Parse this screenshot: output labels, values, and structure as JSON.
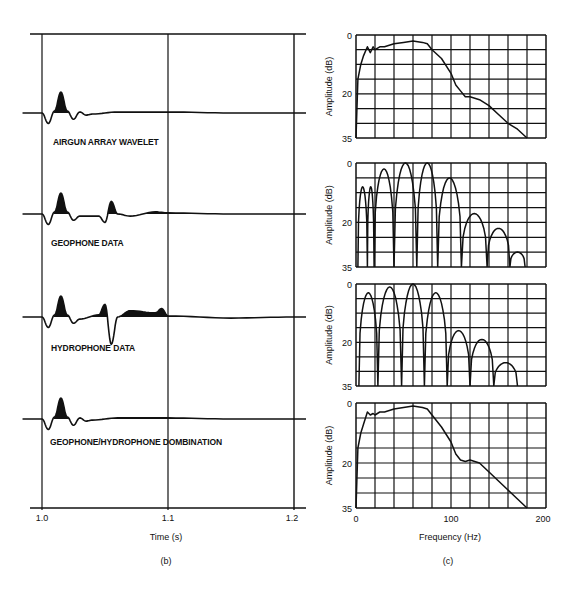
{
  "figure": {
    "panel_b": {
      "caption": "(b)",
      "xlabel": "Time (s)",
      "xticks": [
        "1.0",
        "1.1",
        "1.2"
      ],
      "traces": [
        {
          "label": "AIRGUN ARRAY WAVELET"
        },
        {
          "label": "GEOPHONE DATA"
        },
        {
          "label": "HYDROPHONE DATA"
        },
        {
          "label": "GEOPHONE/HYDROPHONE DOMBINATION"
        }
      ]
    },
    "panel_c": {
      "caption": "(c)",
      "xlabel": "Frequency (Hz)",
      "ylabel": "Amplitude (dB)",
      "xticks": [
        "0",
        "100",
        "200"
      ],
      "yticks": [
        "0",
        "20",
        "35"
      ]
    }
  },
  "chart_data": [
    {
      "type": "line",
      "title": "Panel (b): time-domain traces",
      "xlabel": "Time (s)",
      "ylabel": "",
      "xlim": [
        1.0,
        1.2
      ],
      "xticks": [
        1.0,
        1.1,
        1.2
      ],
      "grid": true,
      "series": [
        {
          "name": "AIRGUN ARRAY WAVELET",
          "x": [
            0.985,
            1.0,
            1.005,
            1.01,
            1.015,
            1.02,
            1.025,
            1.03,
            1.035,
            1.04,
            1.06,
            1.1,
            1.15,
            1.2
          ],
          "values": [
            0,
            0,
            -0.5,
            0.1,
            1.0,
            0.1,
            -0.3,
            0.05,
            -0.1,
            -0.05,
            0.05,
            0.05,
            0,
            0
          ]
        },
        {
          "name": "GEOPHONE DATA",
          "x": [
            0.985,
            1.0,
            1.005,
            1.01,
            1.015,
            1.02,
            1.025,
            1.03,
            1.045,
            1.05,
            1.055,
            1.06,
            1.07,
            1.09,
            1.1,
            1.15,
            1.2
          ],
          "values": [
            0,
            0,
            -0.5,
            0.1,
            1.0,
            0.1,
            -0.3,
            -0.1,
            -0.1,
            -0.4,
            0.6,
            0.0,
            -0.1,
            0.1,
            0.05,
            0,
            0
          ]
        },
        {
          "name": "HYDROPHONE DATA",
          "x": [
            0.985,
            1.0,
            1.005,
            1.01,
            1.015,
            1.02,
            1.025,
            1.03,
            1.045,
            1.05,
            1.055,
            1.06,
            1.07,
            1.09,
            1.095,
            1.1,
            1.15,
            1.2
          ],
          "values": [
            0,
            0,
            -0.5,
            0.1,
            1.0,
            0.1,
            -0.3,
            -0.1,
            0.1,
            0.6,
            -1.3,
            0.0,
            0.3,
            0.2,
            0.4,
            0.05,
            -0.05,
            0
          ]
        },
        {
          "name": "GEOPHONE/HYDROPHONE DOMBINATION",
          "x": [
            0.985,
            1.0,
            1.005,
            1.01,
            1.015,
            1.02,
            1.025,
            1.03,
            1.035,
            1.04,
            1.06,
            1.1,
            1.15,
            1.2
          ],
          "values": [
            0,
            0,
            -0.5,
            0.1,
            1.0,
            0.1,
            -0.3,
            0.05,
            -0.1,
            -0.05,
            0.05,
            0.05,
            0,
            0
          ]
        }
      ]
    },
    {
      "type": "line",
      "title": "Panel (c) #1: Airgun array wavelet spectrum",
      "xlabel": "Frequency (Hz)",
      "ylabel": "Amplitude (dB)",
      "xlim": [
        0,
        200
      ],
      "ylim": [
        35,
        0
      ],
      "grid": true,
      "x": [
        0,
        2,
        5,
        8,
        12,
        15,
        18,
        20,
        25,
        30,
        40,
        50,
        60,
        70,
        75,
        80,
        90,
        100,
        105,
        110,
        115,
        120,
        130,
        140,
        150,
        160,
        170,
        180
      ],
      "values": [
        35,
        15,
        10,
        7,
        4,
        6,
        4,
        5,
        4,
        4,
        3,
        2.5,
        2,
        2.5,
        3,
        5,
        8,
        13,
        17,
        19,
        21,
        21,
        22,
        24,
        27,
        30,
        32,
        35
      ]
    },
    {
      "type": "line",
      "title": "Panel (c) #2: Geophone data spectrum",
      "xlabel": "Frequency (Hz)",
      "ylabel": "Amplitude (dB)",
      "xlim": [
        0,
        200
      ],
      "ylim": [
        35,
        0
      ],
      "grid": true,
      "lobes": [
        {
          "from": 2,
          "to": 12,
          "peak_db": 8
        },
        {
          "from": 12,
          "to": 19,
          "peak_db": 8
        },
        {
          "from": 19,
          "to": 40,
          "peak_db": 2
        },
        {
          "from": 40,
          "to": 64,
          "peak_db": 0
        },
        {
          "from": 64,
          "to": 86,
          "peak_db": 0
        },
        {
          "from": 86,
          "to": 111,
          "peak_db": 5
        },
        {
          "from": 111,
          "to": 138,
          "peak_db": 17
        },
        {
          "from": 138,
          "to": 162,
          "peak_db": 22
        },
        {
          "from": 162,
          "to": 178,
          "peak_db": 30
        }
      ]
    },
    {
      "type": "line",
      "title": "Panel (c) #3: Hydrophone data spectrum",
      "xlabel": "Frequency (Hz)",
      "ylabel": "Amplitude (dB)",
      "xlim": [
        0,
        200
      ],
      "ylim": [
        35,
        0
      ],
      "grid": true,
      "lobes": [
        {
          "from": 3,
          "to": 23,
          "peak_db": 3
        },
        {
          "from": 23,
          "to": 48,
          "peak_db": 1
        },
        {
          "from": 48,
          "to": 72,
          "peak_db": 0
        },
        {
          "from": 72,
          "to": 96,
          "peak_db": 3
        },
        {
          "from": 96,
          "to": 120,
          "peak_db": 16
        },
        {
          "from": 120,
          "to": 145,
          "peak_db": 19
        },
        {
          "from": 145,
          "to": 170,
          "peak_db": 27
        }
      ]
    },
    {
      "type": "line",
      "title": "Panel (c) #4: Geophone/hydrophone combination spectrum",
      "xlabel": "Frequency (Hz)",
      "ylabel": "Amplitude (dB)",
      "xlim": [
        0,
        200
      ],
      "ylim": [
        35,
        0
      ],
      "grid": true,
      "x": [
        0,
        2,
        5,
        8,
        12,
        15,
        18,
        20,
        25,
        30,
        40,
        50,
        60,
        70,
        75,
        80,
        90,
        100,
        105,
        110,
        115,
        120,
        130,
        140,
        150,
        160,
        170,
        180
      ],
      "values": [
        35,
        15,
        10,
        7,
        3,
        4,
        3.5,
        4,
        3,
        3,
        2,
        1.5,
        1,
        1.5,
        2,
        4,
        8,
        13,
        17,
        19,
        19.5,
        19,
        20,
        23,
        26,
        29,
        32,
        35
      ]
    }
  ]
}
